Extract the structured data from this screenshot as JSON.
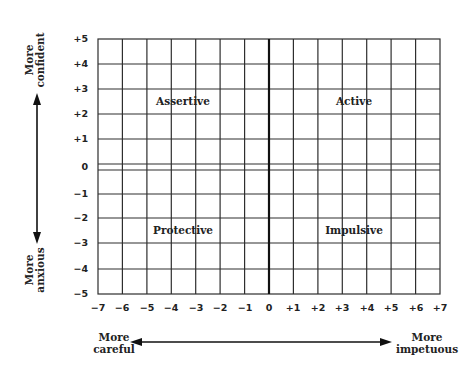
{
  "diagram": {
    "type": "quadrant-grid",
    "y_axis": {
      "ticks": [
        "+5",
        "+4",
        "+3",
        "+2",
        "+1",
        "0",
        "−1",
        "−2",
        "−3",
        "−4",
        "−5"
      ],
      "top_label_line1": "More",
      "top_label_line2": "confident",
      "bottom_label_line1": "More",
      "bottom_label_line2": "anxious"
    },
    "x_axis": {
      "ticks": [
        "−7",
        "−6",
        "−5",
        "−4",
        "−3",
        "−2",
        "−1",
        "0",
        "+1",
        "+2",
        "+3",
        "+4",
        "+5",
        "+6",
        "+7"
      ],
      "left_label_line1": "More",
      "left_label_line2": "careful",
      "right_label_line1": "More",
      "right_label_line2": "impetuous"
    },
    "quadrants": {
      "top_left": "Assertive",
      "top_right": "Active",
      "bottom_left": "Protective",
      "bottom_right": "Impulsive"
    },
    "colors": {
      "line": "#2a2a2a",
      "background": "#ffffff"
    }
  }
}
